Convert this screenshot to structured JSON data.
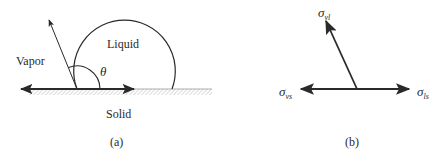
{
  "panel_a": {
    "caption": "(a)",
    "labels": {
      "liquid": "Liquid",
      "vapor": "Vapor",
      "solid": "Solid",
      "angle": "θ"
    }
  },
  "panel_b": {
    "caption": "(b)",
    "labels": {
      "sigma_vl_main": "σ",
      "sigma_vl_sub": "vl",
      "sigma_vs_main": "σ",
      "sigma_vs_sub": "vs",
      "sigma_ls_main": "σ",
      "sigma_ls_sub": "ls"
    }
  },
  "colors": {
    "stroke": "#2a2a2a",
    "hatch": "#9a9a9a"
  }
}
